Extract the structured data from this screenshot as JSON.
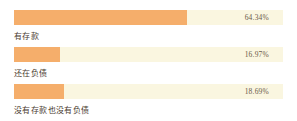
{
  "chart_data": {
    "type": "bar",
    "orientation": "horizontal",
    "title": "",
    "xlabel": "",
    "ylabel": "",
    "xlim": [
      0,
      100
    ],
    "grid": false,
    "legend": null,
    "categories": [
      "有存款",
      "还在负债",
      "没有存款也没有负债"
    ],
    "values": [
      64.34,
      16.97,
      18.69
    ],
    "value_labels": [
      "64.34%",
      "16.97%",
      "18.69%"
    ],
    "colors": {
      "bar_fill": "#f5ae6b",
      "bar_track": "#faf6e0",
      "value_text": "#6b5a4a",
      "label_text": "#4a3b30",
      "background": "#ffffff"
    }
  },
  "rows": [
    {
      "label": "有存款",
      "value": "64.34%",
      "pct": 64.34
    },
    {
      "label": "还在负债",
      "value": "16.97%",
      "pct": 16.97
    },
    {
      "label": "没有存款也没有负债",
      "value": "18.69%",
      "pct": 18.69
    }
  ]
}
